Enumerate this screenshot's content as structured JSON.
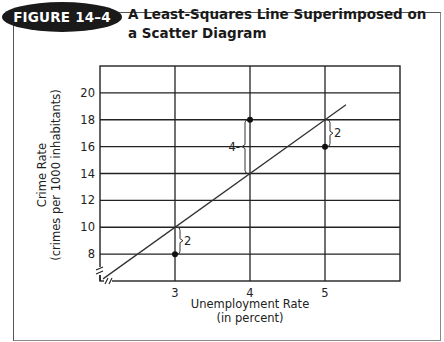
{
  "figure": {
    "badge": "FIGURE 14–4",
    "title": "A Least-Squares Line Superimposed on a Scatter Diagram"
  },
  "chart_data": {
    "type": "scatter",
    "title": "A Least-Squares Line Superimposed on a Scatter Diagram",
    "xlabel": "Unemployment Rate (in percent)",
    "xlabel_lines": [
      "Unemployment Rate",
      "(in percent)"
    ],
    "ylabel": "Crime Rate (crimes per 1000 inhabitants)",
    "ylabel_lines": [
      "Crime Rate",
      "(crimes per 1000 inhabitants)"
    ],
    "xlim": [
      2,
      6
    ],
    "ylim": [
      6,
      22
    ],
    "x_ticks": [
      3,
      4,
      5
    ],
    "y_ticks": [
      8,
      10,
      12,
      14,
      16,
      18,
      20
    ],
    "grid": true,
    "axis_breaks": true,
    "points": [
      {
        "x": 3,
        "y": 8
      },
      {
        "x": 4,
        "y": 18
      },
      {
        "x": 5,
        "y": 16
      }
    ],
    "regression_line": {
      "slope": 4,
      "intercept": -2,
      "equation": "y = 4x - 2",
      "x_start": 2.04,
      "x_end": 5.28
    },
    "residual_annotations": [
      {
        "x": 3,
        "from": 8,
        "to": 10,
        "label": "2"
      },
      {
        "x": 4,
        "from": 14,
        "to": 18,
        "label": "4"
      },
      {
        "x": 5,
        "from": 16,
        "to": 18,
        "label": "2"
      }
    ]
  }
}
